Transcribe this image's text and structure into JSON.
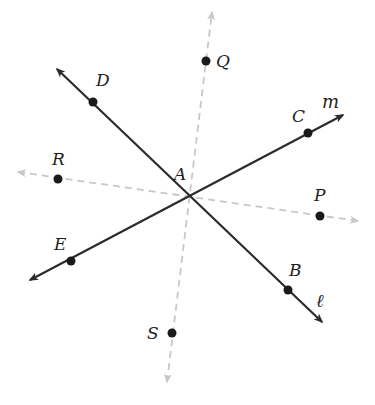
{
  "diagram": {
    "intersection_point": "A",
    "lines": [
      {
        "name": "l",
        "label": "ℓ",
        "style": "solid",
        "points": [
          "D",
          "A",
          "B"
        ],
        "color": "#2b2b2b"
      },
      {
        "name": "m",
        "label": "m",
        "style": "solid",
        "points": [
          "E",
          "A",
          "C"
        ],
        "color": "#2b2b2b"
      },
      {
        "name": "QS",
        "label": "",
        "style": "dashed",
        "points": [
          "Q",
          "A",
          "S"
        ],
        "color": "#c8c8c8"
      },
      {
        "name": "RP",
        "label": "",
        "style": "dashed",
        "points": [
          "R",
          "A",
          "P"
        ],
        "color": "#c8c8c8"
      }
    ],
    "points": {
      "A": "A",
      "B": "B",
      "C": "C",
      "D": "D",
      "E": "E",
      "P": "P",
      "Q": "Q",
      "R": "R",
      "S": "S"
    },
    "line_labels": {
      "l": "ℓ",
      "m": "m"
    }
  }
}
